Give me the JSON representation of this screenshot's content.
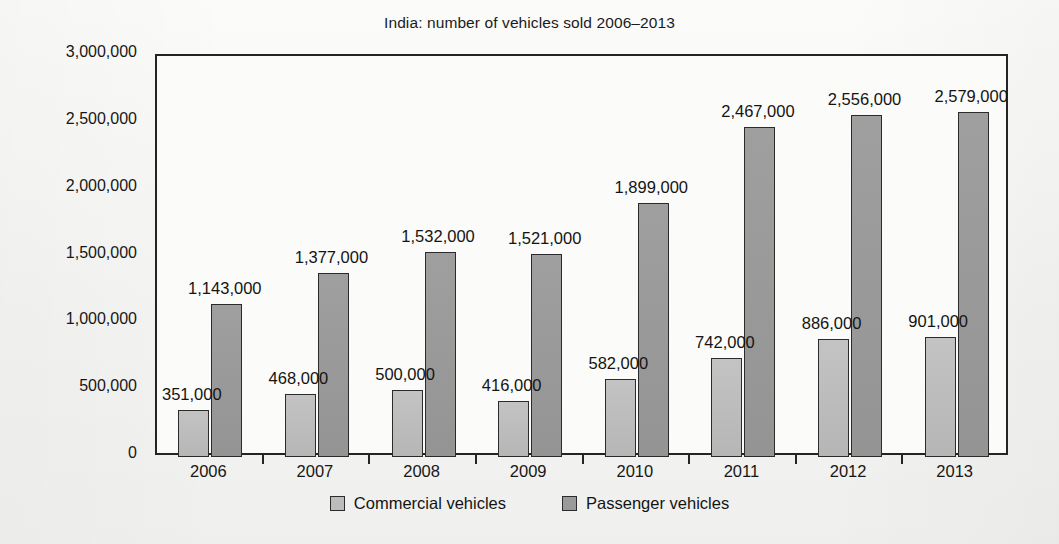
{
  "chart_data": {
    "type": "bar",
    "title": "India: number of vehicles sold 2006–2013",
    "xlabel": "",
    "ylabel": "",
    "categories": [
      "2006",
      "2007",
      "2008",
      "2009",
      "2010",
      "2011",
      "2012",
      "2013"
    ],
    "series": [
      {
        "name": "Commercial vehicles",
        "color": "#bcbcbc",
        "values": [
          351000,
          468000,
          500000,
          416000,
          582000,
          742000,
          886000,
          901000
        ],
        "value_labels": [
          "351,000",
          "468,000",
          "500,000",
          "416,000",
          "582,000",
          "742,000",
          "886,000",
          "901,000"
        ]
      },
      {
        "name": "Passenger vehicles",
        "color": "#9a9a9a",
        "values": [
          1143000,
          1377000,
          1532000,
          1521000,
          1899000,
          2467000,
          2556000,
          2579000
        ],
        "value_labels": [
          "1,143,000",
          "1,377,000",
          "1,532,000",
          "1,521,000",
          "1,899,000",
          "2,467,000",
          "2,556,000",
          "2,579,000"
        ]
      }
    ],
    "ylim": [
      0,
      3000000
    ],
    "yticks": [
      0,
      500000,
      1000000,
      1500000,
      2000000,
      2500000,
      3000000
    ],
    "ytick_labels": [
      "0",
      "500,000",
      "1,000,000",
      "1,500,000",
      "2,000,000",
      "2,500,000",
      "3,000,000"
    ],
    "grid": false,
    "legend_position": "bottom"
  },
  "legend": {
    "items": [
      {
        "label": "Commercial vehicles",
        "swatch": "commercial"
      },
      {
        "label": "Passenger vehicles",
        "swatch": "passenger"
      }
    ]
  }
}
